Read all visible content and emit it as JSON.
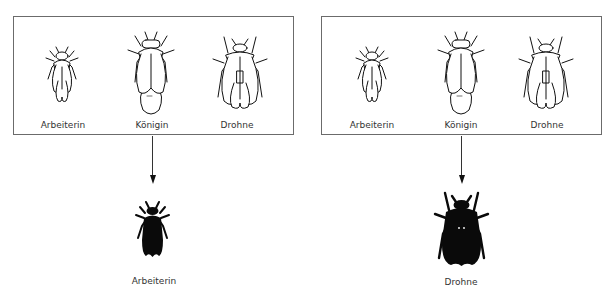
{
  "panels": [
    {
      "id": "left",
      "bees": [
        {
          "caste": "worker",
          "label": "Arbeiterin"
        },
        {
          "caste": "queen",
          "label": "Königin"
        },
        {
          "caste": "drone",
          "label": "Drohne"
        }
      ],
      "result": {
        "caste": "worker",
        "label": "Arbeiterin"
      }
    },
    {
      "id": "right",
      "bees": [
        {
          "caste": "worker",
          "label": "Arbeiterin"
        },
        {
          "caste": "queen",
          "label": "Königin"
        },
        {
          "caste": "drone",
          "label": "Drohne"
        }
      ],
      "result": {
        "caste": "drone",
        "label": "Drohne"
      }
    }
  ],
  "colors": {
    "outline": "#111111",
    "frame": "#6b6b6b",
    "silhouette": "#0a0a0a"
  }
}
